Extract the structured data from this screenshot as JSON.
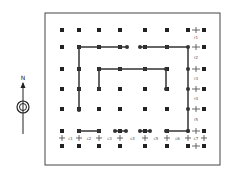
{
  "compass": {
    "label": "N",
    "icon": "north-arrow-icon"
  },
  "grid": {
    "columns_x": [
      62,
      79,
      99,
      120,
      145,
      167,
      188,
      204
    ],
    "rows_y": [
      30,
      47,
      69,
      89,
      109,
      131,
      146
    ],
    "marker_color": "#222222",
    "line_color": "#333333"
  },
  "paths": [
    {
      "name": "outer-path-left",
      "points": [
        [
          79,
          110
        ],
        [
          79,
          47
        ],
        [
          127,
          47
        ]
      ]
    },
    {
      "name": "outer-path-right",
      "points": [
        [
          140,
          47
        ],
        [
          188,
          47
        ],
        [
          188,
          131
        ]
      ]
    },
    {
      "name": "inner-path",
      "points": [
        [
          99,
          89
        ],
        [
          99,
          69
        ],
        [
          166,
          69
        ],
        [
          166,
          89
        ]
      ]
    },
    {
      "name": "bottom-segment-1",
      "points": [
        [
          79,
          131
        ],
        [
          99,
          131
        ]
      ]
    },
    {
      "name": "bottom-segment-2",
      "points": [
        [
          115,
          131
        ],
        [
          126,
          131
        ]
      ]
    },
    {
      "name": "bottom-segment-3",
      "points": [
        [
          140,
          131
        ],
        [
          150,
          131
        ]
      ]
    },
    {
      "name": "bottom-segment-4",
      "points": [
        [
          166,
          131
        ],
        [
          188,
          131
        ]
      ]
    }
  ],
  "right_labels": [
    "r1",
    "r2",
    "r3",
    "r4",
    "r5"
  ],
  "bottom_labels": [
    "c1",
    "c2",
    "c3",
    "c4",
    "c5",
    "c6",
    "c7"
  ]
}
